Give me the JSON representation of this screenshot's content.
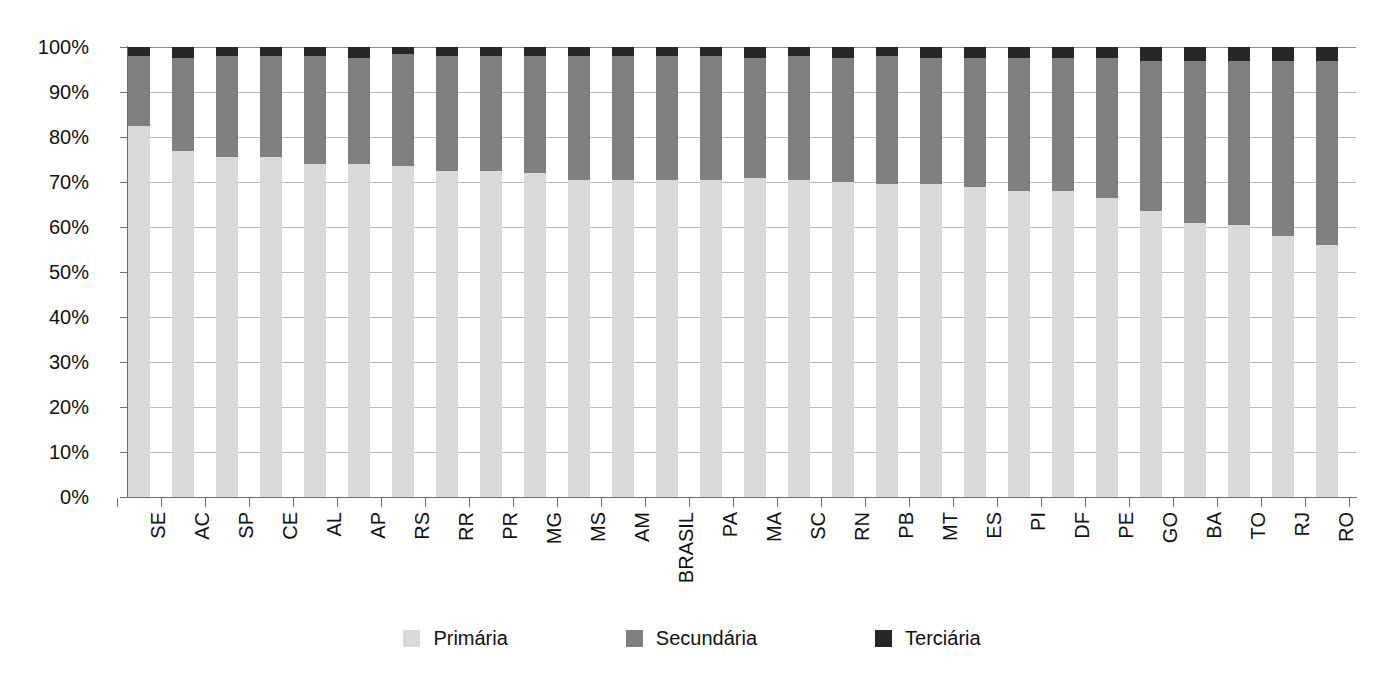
{
  "chart_data": {
    "type": "bar",
    "subtype": "stacked-percent",
    "title": "",
    "xlabel": "",
    "ylabel": "",
    "ylim": [
      0,
      100
    ],
    "ytick_labels": [
      "100%",
      "90%",
      "80%",
      "70%",
      "60%",
      "50%",
      "40%",
      "30%",
      "20%",
      "10%",
      "0%"
    ],
    "ytick_values": [
      100,
      90,
      80,
      70,
      60,
      50,
      40,
      30,
      20,
      10,
      0
    ],
    "grid": true,
    "legend_position": "bottom",
    "categories": [
      "SE",
      "AC",
      "SP",
      "CE",
      "AL",
      "AP",
      "RS",
      "RR",
      "PR",
      "MG",
      "MS",
      "AM",
      "BRASIL",
      "PA",
      "MA",
      "SC",
      "RN",
      "PB",
      "MT",
      "ES",
      "PI",
      "DF",
      "PE",
      "GO",
      "BA",
      "TO",
      "RJ",
      "RO"
    ],
    "series": [
      {
        "name": "Primária",
        "color": "#d9d9d9",
        "values": [
          82.5,
          77.0,
          75.5,
          75.5,
          74.0,
          74.0,
          73.5,
          72.5,
          72.5,
          72.0,
          70.5,
          70.5,
          70.5,
          70.5,
          71.0,
          70.5,
          70.0,
          69.5,
          69.5,
          69.0,
          68.0,
          68.0,
          66.5,
          63.5,
          61.0,
          60.5,
          58.0,
          56.0
        ]
      },
      {
        "name": "Secundária",
        "color": "#7f7f7f",
        "values": [
          15.5,
          20.5,
          22.5,
          22.5,
          24.0,
          23.5,
          25.0,
          25.5,
          25.5,
          26.0,
          27.5,
          27.5,
          27.5,
          27.5,
          26.5,
          27.5,
          27.5,
          28.5,
          28.0,
          28.5,
          29.5,
          29.5,
          31.0,
          33.5,
          36.0,
          36.5,
          39.0,
          41.0
        ]
      },
      {
        "name": "Terciária",
        "color": "#262626",
        "values": [
          2.0,
          2.5,
          2.0,
          2.0,
          2.0,
          2.5,
          1.5,
          2.0,
          2.0,
          2.0,
          2.0,
          2.0,
          2.0,
          2.0,
          2.5,
          2.0,
          2.5,
          2.0,
          2.5,
          2.5,
          2.5,
          2.5,
          2.5,
          3.0,
          3.0,
          3.0,
          3.0,
          3.0
        ]
      }
    ]
  },
  "legend": {
    "items": [
      {
        "label": "Primária",
        "color": "#d9d9d9"
      },
      {
        "label": "Secundária",
        "color": "#7f7f7f"
      },
      {
        "label": "Terciária",
        "color": "#262626"
      }
    ]
  }
}
